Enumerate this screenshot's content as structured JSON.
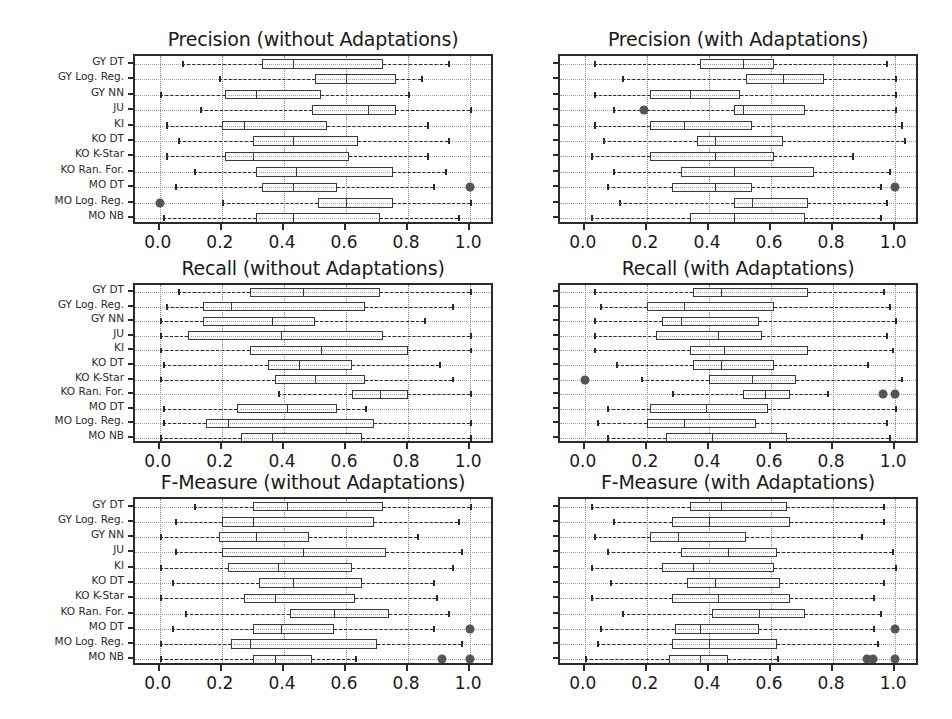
{
  "figure": {
    "width": 952,
    "height": 719,
    "background": "#ffffff",
    "box_fill": "#fbfbfb",
    "line_color": "#2b2b2b",
    "flier_color": "#555555",
    "grid_color": "#8c8c8c"
  },
  "categories": [
    "GY DT",
    "GY Log. Reg.",
    "GY NN",
    "JU",
    "KI",
    "KO DT",
    "KO K-Star",
    "KO Ran. For.",
    "MO DT",
    "MO Log. Reg.",
    "MO NB"
  ],
  "xticks": [
    "0.0",
    "0.2",
    "0.4",
    "0.6",
    "0.8",
    "1.0"
  ],
  "xtick_values": [
    0.0,
    0.2,
    0.4,
    0.6,
    0.8,
    1.0
  ],
  "xlim": [
    -0.08,
    1.08
  ],
  "chart_data": [
    {
      "id": "precision-without",
      "type": "box",
      "title": "Precision (without Adaptations)",
      "xlabel": "",
      "ylabel": "",
      "xlim": [
        -0.08,
        1.08
      ],
      "grid": true,
      "categories": [
        "GY DT",
        "GY Log. Reg.",
        "GY NN",
        "JU",
        "KI",
        "KO DT",
        "KO K-Star",
        "KO Ran. For.",
        "MO DT",
        "MO Log. Reg.",
        "MO NB"
      ],
      "boxes": [
        {
          "category": "GY DT",
          "whisker_low": 0.07,
          "q1": 0.33,
          "median": 0.43,
          "q3": 0.72,
          "whisker_high": 0.93,
          "fliers": []
        },
        {
          "category": "GY Log. Reg.",
          "whisker_low": 0.19,
          "q1": 0.5,
          "median": 0.6,
          "q3": 0.76,
          "whisker_high": 0.84,
          "fliers": []
        },
        {
          "category": "GY NN",
          "whisker_low": 0.0,
          "q1": 0.21,
          "median": 0.31,
          "q3": 0.52,
          "whisker_high": 0.8,
          "fliers": []
        },
        {
          "category": "JU",
          "whisker_low": 0.13,
          "q1": 0.49,
          "median": 0.67,
          "q3": 0.76,
          "whisker_high": 1.0,
          "fliers": []
        },
        {
          "category": "KI",
          "whisker_low": 0.02,
          "q1": 0.2,
          "median": 0.27,
          "q3": 0.54,
          "whisker_high": 0.86,
          "fliers": []
        },
        {
          "category": "KO DT",
          "whisker_low": 0.06,
          "q1": 0.3,
          "median": 0.43,
          "q3": 0.64,
          "whisker_high": 0.93,
          "fliers": []
        },
        {
          "category": "KO K-Star",
          "whisker_low": 0.02,
          "q1": 0.21,
          "median": 0.3,
          "q3": 0.61,
          "whisker_high": 0.86,
          "fliers": []
        },
        {
          "category": "KO Ran. For.",
          "whisker_low": 0.11,
          "q1": 0.31,
          "median": 0.44,
          "q3": 0.75,
          "whisker_high": 0.92,
          "fliers": []
        },
        {
          "category": "MO DT",
          "whisker_low": 0.05,
          "q1": 0.33,
          "median": 0.43,
          "q3": 0.57,
          "whisker_high": 0.88,
          "fliers": [
            1.0
          ]
        },
        {
          "category": "MO Log. Reg.",
          "whisker_low": 0.2,
          "q1": 0.51,
          "median": 0.6,
          "q3": 0.75,
          "whisker_high": 1.0,
          "fliers": [
            0.0
          ]
        },
        {
          "category": "MO NB",
          "whisker_low": 0.01,
          "q1": 0.31,
          "median": 0.43,
          "q3": 0.71,
          "whisker_high": 0.96,
          "fliers": []
        }
      ]
    },
    {
      "id": "precision-with",
      "type": "box",
      "title": "Precision (with Adaptations)",
      "xlabel": "",
      "ylabel": "",
      "xlim": [
        -0.08,
        1.08
      ],
      "grid": true,
      "categories": [
        "GY DT",
        "GY Log. Reg.",
        "GY NN",
        "JU",
        "KI",
        "KO DT",
        "KO K-Star",
        "KO Ran. For.",
        "MO DT",
        "MO Log. Reg.",
        "MO NB"
      ],
      "boxes": [
        {
          "category": "GY DT",
          "whisker_low": 0.03,
          "q1": 0.37,
          "median": 0.51,
          "q3": 0.61,
          "whisker_high": 0.97,
          "fliers": []
        },
        {
          "category": "GY Log. Reg.",
          "whisker_low": 0.12,
          "q1": 0.52,
          "median": 0.64,
          "q3": 0.77,
          "whisker_high": 1.0,
          "fliers": []
        },
        {
          "category": "GY NN",
          "whisker_low": 0.03,
          "q1": 0.21,
          "median": 0.34,
          "q3": 0.5,
          "whisker_high": 1.0,
          "fliers": []
        },
        {
          "category": "JU",
          "whisker_low": 0.09,
          "q1": 0.48,
          "median": 0.51,
          "q3": 0.71,
          "whisker_high": 1.0,
          "fliers": [
            0.19
          ]
        },
        {
          "category": "KI",
          "whisker_low": 0.03,
          "q1": 0.21,
          "median": 0.32,
          "q3": 0.54,
          "whisker_high": 1.02,
          "fliers": []
        },
        {
          "category": "KO DT",
          "whisker_low": 0.06,
          "q1": 0.36,
          "median": 0.42,
          "q3": 0.64,
          "whisker_high": 1.03,
          "fliers": []
        },
        {
          "category": "KO K-Star",
          "whisker_low": 0.02,
          "q1": 0.21,
          "median": 0.42,
          "q3": 0.61,
          "whisker_high": 0.86,
          "fliers": []
        },
        {
          "category": "KO Ran. For.",
          "whisker_low": 0.09,
          "q1": 0.31,
          "median": 0.48,
          "q3": 0.74,
          "whisker_high": 0.98,
          "fliers": []
        },
        {
          "category": "MO DT",
          "whisker_low": 0.07,
          "q1": 0.28,
          "median": 0.42,
          "q3": 0.54,
          "whisker_high": 0.95,
          "fliers": [
            1.0
          ]
        },
        {
          "category": "MO Log. Reg.",
          "whisker_low": 0.11,
          "q1": 0.48,
          "median": 0.54,
          "q3": 0.72,
          "whisker_high": 0.97,
          "fliers": []
        },
        {
          "category": "MO NB",
          "whisker_low": 0.02,
          "q1": 0.34,
          "median": 0.48,
          "q3": 0.71,
          "whisker_high": 0.95,
          "fliers": []
        }
      ]
    },
    {
      "id": "recall-without",
      "type": "box",
      "title": "Recall (without Adaptations)",
      "xlabel": "",
      "ylabel": "",
      "xlim": [
        -0.08,
        1.08
      ],
      "grid": true,
      "categories": [
        "GY DT",
        "GY Log. Reg.",
        "GY NN",
        "JU",
        "KI",
        "KO DT",
        "KO K-Star",
        "KO Ran. For.",
        "MO DT",
        "MO Log. Reg.",
        "MO NB"
      ],
      "boxes": [
        {
          "category": "GY DT",
          "whisker_low": 0.06,
          "q1": 0.29,
          "median": 0.46,
          "q3": 0.71,
          "whisker_high": 1.0,
          "fliers": []
        },
        {
          "category": "GY Log. Reg.",
          "whisker_low": 0.02,
          "q1": 0.14,
          "median": 0.23,
          "q3": 0.66,
          "whisker_high": 0.94,
          "fliers": []
        },
        {
          "category": "GY NN",
          "whisker_low": 0.0,
          "q1": 0.14,
          "median": 0.36,
          "q3": 0.5,
          "whisker_high": 0.85,
          "fliers": []
        },
        {
          "category": "JU",
          "whisker_low": 0.0,
          "q1": 0.09,
          "median": 0.39,
          "q3": 0.72,
          "whisker_high": 1.0,
          "fliers": []
        },
        {
          "category": "KI",
          "whisker_low": 0.0,
          "q1": 0.29,
          "median": 0.52,
          "q3": 0.8,
          "whisker_high": 1.0,
          "fliers": []
        },
        {
          "category": "KO DT",
          "whisker_low": 0.01,
          "q1": 0.35,
          "median": 0.45,
          "q3": 0.62,
          "whisker_high": 0.9,
          "fliers": []
        },
        {
          "category": "KO K-Star",
          "whisker_low": 0.0,
          "q1": 0.37,
          "median": 0.5,
          "q3": 0.66,
          "whisker_high": 0.94,
          "fliers": []
        },
        {
          "category": "KO Ran. For.",
          "whisker_low": 0.38,
          "q1": 0.62,
          "median": 0.71,
          "q3": 0.8,
          "whisker_high": 1.0,
          "fliers": []
        },
        {
          "category": "MO DT",
          "whisker_low": 0.01,
          "q1": 0.25,
          "median": 0.41,
          "q3": 0.57,
          "whisker_high": 0.66,
          "fliers": []
        },
        {
          "category": "MO Log. Reg.",
          "whisker_low": 0.01,
          "q1": 0.15,
          "median": 0.22,
          "q3": 0.69,
          "whisker_high": 1.0,
          "fliers": []
        },
        {
          "category": "MO NB",
          "whisker_low": 0.0,
          "q1": 0.26,
          "median": 0.36,
          "q3": 0.65,
          "whisker_high": 1.0,
          "fliers": []
        }
      ]
    },
    {
      "id": "recall-with",
      "type": "box",
      "title": "Recall (with Adaptations)",
      "xlabel": "",
      "ylabel": "",
      "xlim": [
        -0.08,
        1.08
      ],
      "grid": true,
      "categories": [
        "GY DT",
        "GY Log. Reg.",
        "GY NN",
        "JU",
        "KI",
        "KO DT",
        "KO K-Star",
        "KO Ran. For.",
        "MO DT",
        "MO Log. Reg.",
        "MO NB"
      ],
      "boxes": [
        {
          "category": "GY DT",
          "whisker_low": 0.03,
          "q1": 0.35,
          "median": 0.44,
          "q3": 0.72,
          "whisker_high": 0.96,
          "fliers": []
        },
        {
          "category": "GY Log. Reg.",
          "whisker_low": 0.05,
          "q1": 0.2,
          "median": 0.32,
          "q3": 0.61,
          "whisker_high": 0.98,
          "fliers": []
        },
        {
          "category": "GY NN",
          "whisker_low": 0.03,
          "q1": 0.25,
          "median": 0.31,
          "q3": 0.56,
          "whisker_high": 1.0,
          "fliers": []
        },
        {
          "category": "JU",
          "whisker_low": 0.03,
          "q1": 0.23,
          "median": 0.43,
          "q3": 0.57,
          "whisker_high": 0.97,
          "fliers": []
        },
        {
          "category": "KI",
          "whisker_low": 0.03,
          "q1": 0.34,
          "median": 0.45,
          "q3": 0.72,
          "whisker_high": 0.99,
          "fliers": []
        },
        {
          "category": "KO DT",
          "whisker_low": 0.1,
          "q1": 0.35,
          "median": 0.44,
          "q3": 0.61,
          "whisker_high": 0.91,
          "fliers": []
        },
        {
          "category": "KO K-Star",
          "whisker_low": 0.18,
          "q1": 0.4,
          "median": 0.54,
          "q3": 0.68,
          "whisker_high": 1.02,
          "fliers": [
            0.0
          ]
        },
        {
          "category": "KO Ran. For.",
          "whisker_low": 0.28,
          "q1": 0.51,
          "median": 0.58,
          "q3": 0.66,
          "whisker_high": 0.78,
          "fliers": [
            0.96,
            1.0
          ]
        },
        {
          "category": "MO DT",
          "whisker_low": 0.07,
          "q1": 0.21,
          "median": 0.39,
          "q3": 0.59,
          "whisker_high": 1.0,
          "fliers": []
        },
        {
          "category": "MO Log. Reg.",
          "whisker_low": 0.04,
          "q1": 0.2,
          "median": 0.32,
          "q3": 0.55,
          "whisker_high": 0.97,
          "fliers": []
        },
        {
          "category": "MO NB",
          "whisker_low": 0.07,
          "q1": 0.26,
          "median": 0.41,
          "q3": 0.65,
          "whisker_high": 0.98,
          "fliers": []
        }
      ]
    },
    {
      "id": "fmeasure-without",
      "type": "box",
      "title": "F-Measure (without Adaptations)",
      "xlabel": "",
      "ylabel": "",
      "xlim": [
        -0.08,
        1.08
      ],
      "grid": true,
      "categories": [
        "GY DT",
        "GY Log. Reg.",
        "GY NN",
        "JU",
        "KI",
        "KO DT",
        "KO K-Star",
        "KO Ran. For.",
        "MO DT",
        "MO Log. Reg.",
        "MO NB"
      ],
      "boxes": [
        {
          "category": "GY DT",
          "whisker_low": 0.11,
          "q1": 0.3,
          "median": 0.41,
          "q3": 0.72,
          "whisker_high": 1.0,
          "fliers": []
        },
        {
          "category": "GY Log. Reg.",
          "whisker_low": 0.05,
          "q1": 0.2,
          "median": 0.3,
          "q3": 0.69,
          "whisker_high": 0.96,
          "fliers": []
        },
        {
          "category": "GY NN",
          "whisker_low": 0.0,
          "q1": 0.19,
          "median": 0.31,
          "q3": 0.48,
          "whisker_high": 0.83,
          "fliers": []
        },
        {
          "category": "JU",
          "whisker_low": 0.05,
          "q1": 0.2,
          "median": 0.46,
          "q3": 0.73,
          "whisker_high": 0.97,
          "fliers": []
        },
        {
          "category": "KI",
          "whisker_low": 0.0,
          "q1": 0.22,
          "median": 0.38,
          "q3": 0.62,
          "whisker_high": 0.94,
          "fliers": []
        },
        {
          "category": "KO DT",
          "whisker_low": 0.04,
          "q1": 0.32,
          "median": 0.43,
          "q3": 0.65,
          "whisker_high": 0.88,
          "fliers": []
        },
        {
          "category": "KO K-Star",
          "whisker_low": 0.0,
          "q1": 0.27,
          "median": 0.37,
          "q3": 0.63,
          "whisker_high": 0.89,
          "fliers": []
        },
        {
          "category": "KO Ran. For.",
          "whisker_low": 0.08,
          "q1": 0.42,
          "median": 0.56,
          "q3": 0.74,
          "whisker_high": 0.93,
          "fliers": []
        },
        {
          "category": "MO DT",
          "whisker_low": 0.04,
          "q1": 0.3,
          "median": 0.39,
          "q3": 0.56,
          "whisker_high": 0.88,
          "fliers": [
            1.0
          ]
        },
        {
          "category": "MO Log. Reg.",
          "whisker_low": 0.0,
          "q1": 0.23,
          "median": 0.29,
          "q3": 0.7,
          "whisker_high": 0.97,
          "fliers": []
        },
        {
          "category": "MO NB",
          "whisker_low": 0.0,
          "q1": 0.3,
          "median": 0.37,
          "q3": 0.49,
          "whisker_high": 0.63,
          "fliers": [
            0.91,
            1.0
          ]
        }
      ]
    },
    {
      "id": "fmeasure-with",
      "type": "box",
      "title": "F-Measure (with Adaptations)",
      "xlabel": "",
      "ylabel": "",
      "xlim": [
        -0.08,
        1.08
      ],
      "grid": true,
      "categories": [
        "GY DT",
        "GY Log. Reg.",
        "GY NN",
        "JU",
        "KI",
        "KO DT",
        "KO K-Star",
        "KO Ran. For.",
        "MO DT",
        "MO Log. Reg.",
        "MO NB"
      ],
      "boxes": [
        {
          "category": "GY DT",
          "whisker_low": 0.02,
          "q1": 0.34,
          "median": 0.44,
          "q3": 0.65,
          "whisker_high": 0.96,
          "fliers": []
        },
        {
          "category": "GY Log. Reg.",
          "whisker_low": 0.09,
          "q1": 0.28,
          "median": 0.4,
          "q3": 0.66,
          "whisker_high": 0.96,
          "fliers": []
        },
        {
          "category": "GY NN",
          "whisker_low": 0.03,
          "q1": 0.21,
          "median": 0.3,
          "q3": 0.52,
          "whisker_high": 0.89,
          "fliers": []
        },
        {
          "category": "JU",
          "whisker_low": 0.07,
          "q1": 0.31,
          "median": 0.46,
          "q3": 0.62,
          "whisker_high": 0.99,
          "fliers": []
        },
        {
          "category": "KI",
          "whisker_low": 0.02,
          "q1": 0.25,
          "median": 0.35,
          "q3": 0.61,
          "whisker_high": 1.0,
          "fliers": []
        },
        {
          "category": "KO DT",
          "whisker_low": 0.08,
          "q1": 0.33,
          "median": 0.42,
          "q3": 0.63,
          "whisker_high": 0.96,
          "fliers": []
        },
        {
          "category": "KO K-Star",
          "whisker_low": 0.02,
          "q1": 0.28,
          "median": 0.43,
          "q3": 0.66,
          "whisker_high": 0.93,
          "fliers": []
        },
        {
          "category": "KO Ran. For.",
          "whisker_low": 0.12,
          "q1": 0.41,
          "median": 0.56,
          "q3": 0.71,
          "whisker_high": 0.95,
          "fliers": []
        },
        {
          "category": "MO DT",
          "whisker_low": 0.05,
          "q1": 0.29,
          "median": 0.37,
          "q3": 0.56,
          "whisker_high": 0.93,
          "fliers": [
            1.0
          ]
        },
        {
          "category": "MO Log. Reg.",
          "whisker_low": 0.04,
          "q1": 0.28,
          "median": 0.4,
          "q3": 0.62,
          "whisker_high": 0.94,
          "fliers": []
        },
        {
          "category": "MO NB",
          "whisker_low": 0.0,
          "q1": 0.27,
          "median": 0.37,
          "q3": 0.46,
          "whisker_high": 0.62,
          "fliers": [
            0.91,
            0.93,
            1.0
          ]
        }
      ]
    }
  ],
  "layout": {
    "panels": [
      {
        "chart": 0,
        "left": 133,
        "top": 54,
        "width": 360,
        "height": 170,
        "title_top": -26,
        "title_left": -60,
        "title_width": 480,
        "show_ylabels": true
      },
      {
        "chart": 1,
        "left": 558,
        "top": 54,
        "width": 360,
        "height": 170,
        "title_top": -26,
        "title_left": -60,
        "title_width": 480,
        "show_ylabels": false
      },
      {
        "chart": 2,
        "left": 133,
        "top": 283,
        "width": 360,
        "height": 160,
        "title_top": -26,
        "title_left": -60,
        "title_width": 480,
        "show_ylabels": true
      },
      {
        "chart": 3,
        "left": 558,
        "top": 283,
        "width": 360,
        "height": 160,
        "title_top": -26,
        "title_left": -60,
        "title_width": 480,
        "show_ylabels": false
      },
      {
        "chart": 4,
        "left": 133,
        "top": 497,
        "width": 360,
        "height": 168,
        "title_top": -26,
        "title_left": -60,
        "title_width": 480,
        "show_ylabels": true
      },
      {
        "chart": 5,
        "left": 558,
        "top": 497,
        "width": 360,
        "height": 168,
        "title_top": -26,
        "title_left": -60,
        "title_width": 480,
        "show_ylabels": false
      }
    ]
  }
}
